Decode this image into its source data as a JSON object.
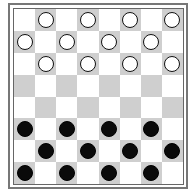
{
  "board": {
    "size": 8,
    "colors": {
      "light": "#ffffff",
      "dark": "#cfcfcf",
      "white_piece": "#ffffff",
      "black_piece": "#0a0a0a"
    },
    "rows": [
      [
        null,
        "w",
        null,
        "w",
        null,
        "w",
        null,
        "w"
      ],
      [
        "w",
        null,
        "w",
        null,
        "w",
        null,
        "w",
        null
      ],
      [
        null,
        "w",
        null,
        "w",
        null,
        "w",
        null,
        "w"
      ],
      [
        null,
        null,
        null,
        null,
        null,
        null,
        null,
        null
      ],
      [
        null,
        null,
        null,
        null,
        null,
        null,
        null,
        null
      ],
      [
        "b",
        null,
        "b",
        null,
        "b",
        null,
        "b",
        null
      ],
      [
        null,
        "b",
        null,
        "b",
        null,
        "b",
        null,
        "b"
      ],
      [
        "b",
        null,
        "b",
        null,
        "b",
        null,
        "b",
        null
      ]
    ]
  }
}
